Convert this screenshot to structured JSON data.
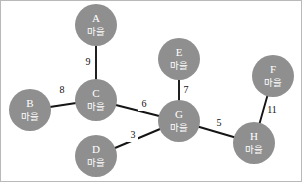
{
  "diagram": {
    "type": "weighted-undirected-graph",
    "title": "",
    "background_color": "#ffffff",
    "border_color": "#b9b9b9",
    "node_fill_color": "#8f8f8f",
    "node_text_color": "#ffffff",
    "edge_color": "#151515",
    "weight_text_color": "#111111",
    "node_radius": 21,
    "nodes": [
      {
        "id": "A",
        "sublabel": "마을",
        "x": 95,
        "y": 24
      },
      {
        "id": "B",
        "sublabel": "마을",
        "x": 29,
        "y": 109
      },
      {
        "id": "C",
        "sublabel": "마을",
        "x": 95,
        "y": 99
      },
      {
        "id": "D",
        "sublabel": "마을",
        "x": 95,
        "y": 155
      },
      {
        "id": "E",
        "sublabel": "마을",
        "x": 178,
        "y": 58
      },
      {
        "id": "F",
        "sublabel": "마을",
        "x": 272,
        "y": 75
      },
      {
        "id": "G",
        "sublabel": "마을",
        "x": 178,
        "y": 120
      },
      {
        "id": "H",
        "sublabel": "마을",
        "x": 253,
        "y": 142
      }
    ],
    "edges": [
      {
        "from": "A",
        "to": "C",
        "weight": "9",
        "label_x": 87,
        "label_y": 62
      },
      {
        "from": "B",
        "to": "C",
        "weight": "8",
        "label_x": 61,
        "label_y": 90
      },
      {
        "from": "C",
        "to": "G",
        "weight": "6",
        "label_x": 143,
        "label_y": 104
      },
      {
        "from": "D",
        "to": "G",
        "weight": "3",
        "label_x": 132,
        "label_y": 135
      },
      {
        "from": "E",
        "to": "G",
        "weight": "7",
        "label_x": 185,
        "label_y": 90
      },
      {
        "from": "G",
        "to": "H",
        "weight": "5",
        "label_x": 218,
        "label_y": 123
      },
      {
        "from": "F",
        "to": "H",
        "weight": "11",
        "label_x": 271,
        "label_y": 110
      }
    ]
  }
}
